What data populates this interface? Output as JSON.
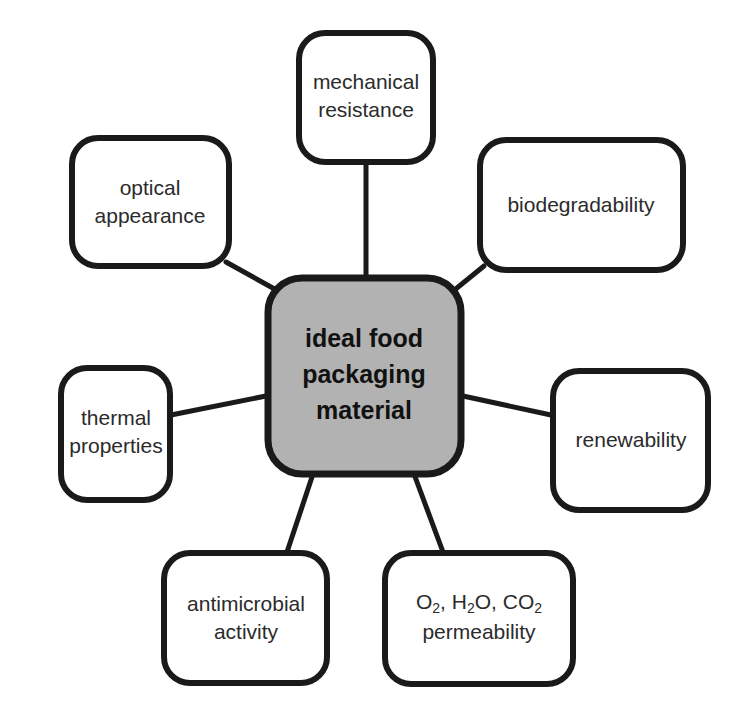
{
  "diagram": {
    "type": "mind-map",
    "title": "ideal food packaging material",
    "center": {
      "id": "center-node",
      "lines": [
        "ideal food",
        "packaging",
        "material"
      ],
      "fill_color": "#b2b2b2",
      "border_color": "#1a1a1a"
    },
    "nodes": [
      {
        "id": "mechanical-resistance",
        "position": "top",
        "lines": [
          "mechanical",
          "resistance"
        ],
        "fill_color": "#ffffff",
        "border_color": "#1a1a1a"
      },
      {
        "id": "optical-appearance",
        "position": "top-left",
        "lines": [
          "optical",
          "appearance"
        ],
        "fill_color": "#ffffff",
        "border_color": "#1a1a1a"
      },
      {
        "id": "biodegradability",
        "position": "top-right",
        "lines": [
          "biodegradability"
        ],
        "fill_color": "#ffffff",
        "border_color": "#1a1a1a"
      },
      {
        "id": "thermal-properties",
        "position": "left",
        "lines": [
          "thermal",
          "properties"
        ],
        "fill_color": "#ffffff",
        "border_color": "#1a1a1a"
      },
      {
        "id": "renewability",
        "position": "right",
        "lines": [
          "renewability"
        ],
        "fill_color": "#ffffff",
        "border_color": "#1a1a1a"
      },
      {
        "id": "antimicrobial-activity",
        "position": "bottom-left",
        "lines": [
          "antimicrobial",
          "activity"
        ],
        "fill_color": "#ffffff",
        "border_color": "#1a1a1a"
      },
      {
        "id": "gas-permeability",
        "position": "bottom-right",
        "lines": [
          "O2, H2O, CO2",
          "permeability"
        ],
        "formula_parts": [
          {
            "text": "O",
            "sub": "2"
          },
          {
            "text": ", H",
            "sub": "2"
          },
          {
            "text": "O, CO",
            "sub": "2"
          }
        ],
        "line2": "permeability",
        "fill_color": "#ffffff",
        "border_color": "#1a1a1a"
      }
    ],
    "connector_color": "#1a1a1a",
    "background_color": "#ffffff"
  }
}
